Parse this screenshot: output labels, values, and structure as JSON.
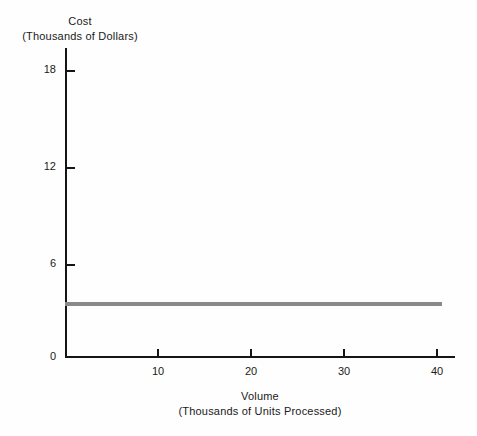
{
  "chart_data": {
    "type": "line",
    "title": "",
    "xlabel": "Volume",
    "xlabel_sub": "(Thousands of Units Processed)",
    "ylabel": "Cost",
    "ylabel_sub": "(Thousands of Dollars)",
    "xlim": [
      0,
      42
    ],
    "ylim": [
      0,
      19.5
    ],
    "xticks": [
      10,
      20,
      30,
      40
    ],
    "yticks": [
      0,
      6,
      12,
      18
    ],
    "grid": false,
    "legend": false,
    "series": [
      {
        "name": "Fixed Cost",
        "color": "#8a8a8a",
        "x": [
          0,
          40.5
        ],
        "values": [
          3.3,
          3.3
        ]
      }
    ]
  },
  "axes": {
    "y_title_main": "Cost",
    "y_title_sub": "(Thousands of Dollars)",
    "x_title_main": "Volume",
    "x_title_sub": "(Thousands of Units Processed)",
    "y_tick_labels": [
      "18",
      "12",
      "6",
      "0"
    ],
    "x_tick_labels": [
      "10",
      "20",
      "30",
      "40"
    ]
  },
  "colors": {
    "background": "#fefefe",
    "axis": "#151515",
    "text": "#1a1a1a",
    "series_fixed_cost": "#8a8a8a"
  }
}
